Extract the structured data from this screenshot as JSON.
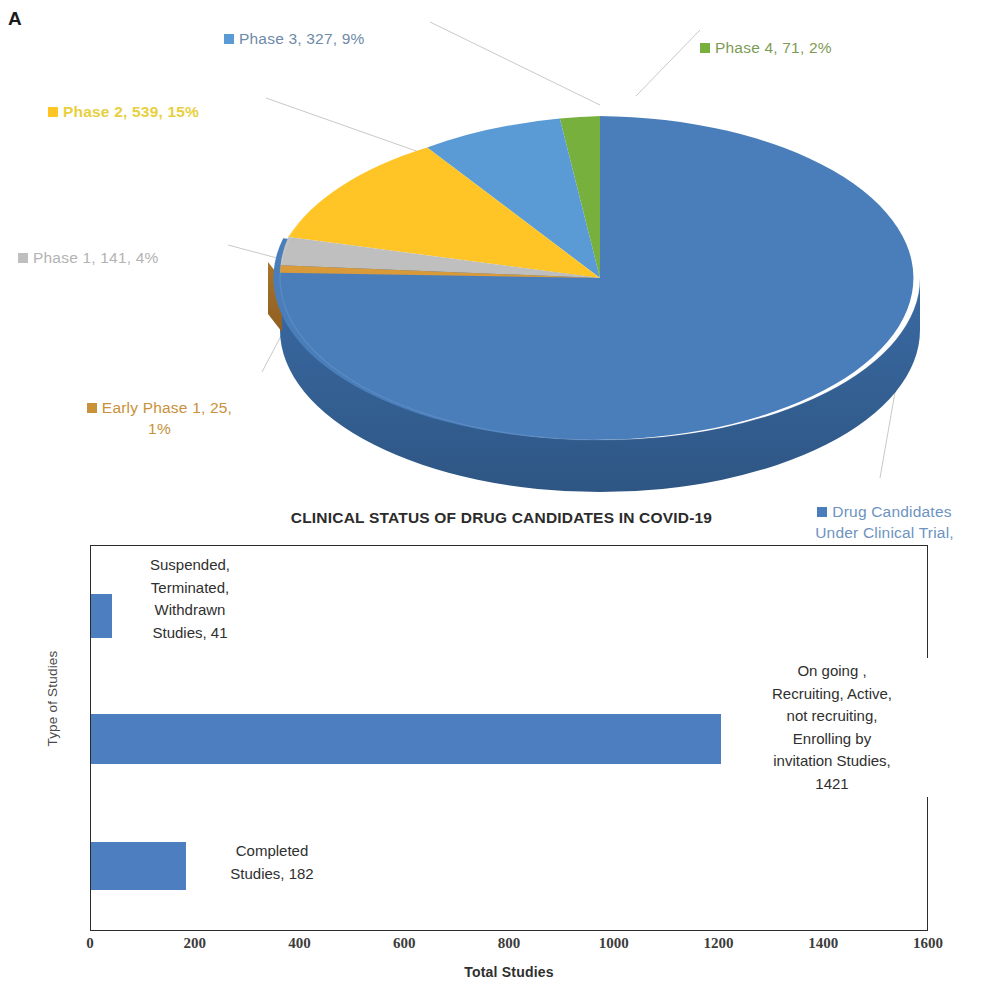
{
  "panels": {
    "a_letter": "A",
    "b_letter": "B"
  },
  "title": "CLINICAL STATUS OF DRUG CANDIDATES IN COVID-19",
  "colors": {
    "main_blue": "#4a7ebb",
    "light_blue": "#5b9bd5",
    "green": "#77b03c",
    "yellow": "#ffc425",
    "gray": "#bfbfbf",
    "orange": "#c8913a",
    "bar_blue": "#4d7ebf",
    "axis": "#2c2c2c"
  },
  "pie": {
    "labels": {
      "phase3": "Phase 3, 327, 9%",
      "phase4": "Phase 4, 71, 2%",
      "phase2": "Phase 2, 539, 15%",
      "phase1": "Phase 1, 141, 4%",
      "early_phase1": "Early Phase 1, 25,\n1%",
      "main": "Drug Candidates\nUnder Clinical Trial,\n2427, 69%"
    }
  },
  "bar": {
    "y_axis_title": "Type of Studies",
    "x_axis_title": "Total Studies",
    "x_ticks": [
      "0",
      "200",
      "400",
      "600",
      "800",
      "1000",
      "1200",
      "1400",
      "1600"
    ],
    "labels": {
      "suspended": "Suspended,\nTerminated,\nWithdrawn\nStudies, 41",
      "ongoing": "On going ,\nRecruiting, Active,\nnot recruiting,\nEnrolling by\ninvitation Studies,\n1421",
      "completed": "Completed\nStudies, 182"
    }
  },
  "chart_data": [
    {
      "type": "pie",
      "title": "CLINICAL STATUS OF DRUG CANDIDATES IN COVID-19",
      "subtitle": "Panel A — distribution of drug candidates by clinical trial phase",
      "categories": [
        "Drug Candidates Under Clinical Trial",
        "Early Phase 1",
        "Phase 1",
        "Phase 2",
        "Phase 3",
        "Phase 4"
      ],
      "values": [
        2427,
        25,
        141,
        539,
        327,
        71
      ],
      "percents": [
        69,
        1,
        4,
        15,
        9,
        2
      ],
      "colors": [
        "#4a7ebb",
        "#c8913a",
        "#bfbfbf",
        "#ffc425",
        "#5b9bd5",
        "#77b03c"
      ],
      "data_labels": [
        "Drug Candidates Under Clinical Trial, 2427, 69%",
        "Early Phase 1, 25, 1%",
        "Phase 1, 141, 4%",
        "Phase 2, 539, 15%",
        "Phase 3, 327, 9%",
        "Phase 4, 71, 2%"
      ],
      "total": 3530,
      "legend": "outside-callouts",
      "three_d": true
    },
    {
      "type": "bar",
      "orientation": "horizontal",
      "title": "CLINICAL STATUS OF DRUG CANDIDATES IN COVID-19",
      "subtitle": "Panel B — number of studies by status",
      "categories": [
        "Suspended, Terminated, Withdrawn Studies",
        "On going , Recruiting, Active, not recruiting, Enrolling by invitation Studies",
        "Completed Studies"
      ],
      "values": [
        41,
        1421,
        182
      ],
      "xlabel": "Total Studies",
      "ylabel": "Type of Studies",
      "xlim": [
        0,
        1600
      ],
      "xticks": [
        0,
        200,
        400,
        600,
        800,
        1000,
        1200,
        1400,
        1600
      ],
      "grid": false,
      "legend": "none",
      "bar_color": "#4d7ebf"
    }
  ]
}
